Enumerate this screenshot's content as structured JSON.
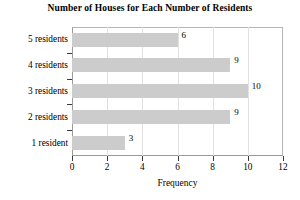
{
  "chart_data": {
    "type": "bar",
    "orientation": "horizontal",
    "title": "Number of Houses for Each Number of Residents",
    "xlabel": "Frequency",
    "ylabel": "",
    "categories": [
      "1 resident",
      "2 residents",
      "3 residents",
      "4 residents",
      "5 residents"
    ],
    "values": [
      3,
      9,
      10,
      9,
      6
    ],
    "data_labels": [
      "3",
      "9",
      "10",
      "9",
      "6"
    ],
    "xlim": [
      0,
      12
    ],
    "xticks": [
      0,
      2,
      4,
      6,
      8,
      10,
      12
    ],
    "xtick_labels": [
      "0",
      "2",
      "4",
      "6",
      "8",
      "10",
      "12"
    ],
    "grid": "vertical",
    "legend": "none",
    "bar_color": "#cccccc",
    "axis_color": "#3a3a3a",
    "grid_color": "#e2e2e2",
    "background": "#ffffff"
  }
}
